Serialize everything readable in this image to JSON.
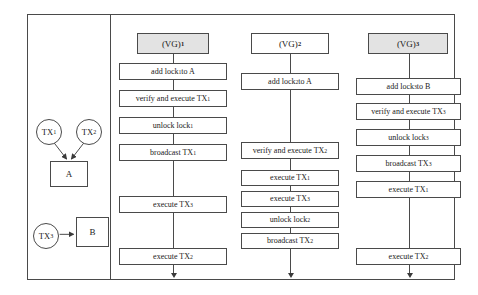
{
  "dependency_graph": {
    "label": "transaction dependency graph",
    "transactions": [
      {
        "id": "tx1",
        "label": "TX",
        "sub": "1"
      },
      {
        "id": "tx2",
        "label": "TX",
        "sub": "2"
      },
      {
        "id": "tx3",
        "label": "TX",
        "sub": "3"
      }
    ],
    "resources": [
      {
        "id": "a",
        "label": "A"
      },
      {
        "id": "b",
        "label": "B"
      }
    ],
    "edges": [
      {
        "from": "tx1",
        "to": "a"
      },
      {
        "from": "tx2",
        "to": "a"
      },
      {
        "from": "tx3",
        "to": "b"
      }
    ]
  },
  "columns": [
    {
      "header": {
        "prefix": "(VG)",
        "sub": "1",
        "shaded": true
      },
      "steps": [
        {
          "text": "add lock",
          "sub": "1",
          "suffix": " to A"
        },
        {
          "text": "verify and execute TX",
          "sub": "1",
          "suffix": ""
        },
        {
          "text": "unlock lock",
          "sub": "1",
          "suffix": ""
        },
        {
          "text": "broadcast TX",
          "sub": "1",
          "suffix": ""
        },
        {
          "text": "execute TX",
          "sub": "3",
          "suffix": ""
        },
        {
          "text": "execute TX",
          "sub": "2",
          "suffix": ""
        }
      ]
    },
    {
      "header": {
        "prefix": "(VG)",
        "sub": "2",
        "shaded": false
      },
      "steps": [
        {
          "text": "add lock",
          "sub": "2",
          "suffix": " to A"
        },
        {
          "text": "verify and execute TX",
          "sub": "2",
          "suffix": ""
        },
        {
          "text": "execute TX",
          "sub": "1",
          "suffix": ""
        },
        {
          "text": "execute TX",
          "sub": "3",
          "suffix": ""
        },
        {
          "text": "unlock lock",
          "sub": "2",
          "suffix": ""
        },
        {
          "text": "broadcast TX",
          "sub": "2",
          "suffix": ""
        }
      ]
    },
    {
      "header": {
        "prefix": "(VG)",
        "sub": "3",
        "shaded": true
      },
      "steps": [
        {
          "text": "add lock",
          "sub": "3",
          "suffix": " to B"
        },
        {
          "text": "verify and execute TX",
          "sub": "3",
          "suffix": ""
        },
        {
          "text": "unlock lock",
          "sub": "3",
          "suffix": ""
        },
        {
          "text": "broadcast TX",
          "sub": "3",
          "suffix": ""
        },
        {
          "text": "execute TX",
          "sub": "1",
          "suffix": ""
        },
        {
          "text": "execute TX",
          "sub": "2",
          "suffix": ""
        }
      ]
    }
  ],
  "layout": {
    "column_boxes": [
      [
        {
          "top": 18,
          "height": 21,
          "left": 18,
          "width": 72
        },
        {
          "top": 48,
          "height": 17,
          "left": 0,
          "width": 108
        },
        {
          "top": 75,
          "height": 17,
          "left": 0,
          "width": 108
        },
        {
          "top": 102,
          "height": 17,
          "left": 0,
          "width": 108
        },
        {
          "top": 129,
          "height": 17,
          "left": 0,
          "width": 108
        },
        {
          "top": 181,
          "height": 17,
          "left": 0,
          "width": 108
        },
        {
          "top": 233,
          "height": 17,
          "left": 0,
          "width": 108
        }
      ],
      [
        {
          "top": 18,
          "height": 21,
          "left": 10,
          "width": 78
        },
        {
          "top": 58,
          "height": 17,
          "left": 0,
          "width": 98
        },
        {
          "top": 127,
          "height": 17,
          "left": 0,
          "width": 98
        },
        {
          "top": 155,
          "height": 16,
          "left": 0,
          "width": 98
        },
        {
          "top": 176,
          "height": 16,
          "left": 0,
          "width": 98
        },
        {
          "top": 197,
          "height": 16,
          "left": 0,
          "width": 98
        },
        {
          "top": 218,
          "height": 16,
          "left": 0,
          "width": 98
        }
      ],
      [
        {
          "top": 18,
          "height": 21,
          "left": 12,
          "width": 80
        },
        {
          "top": 63,
          "height": 17,
          "left": 0,
          "width": 105
        },
        {
          "top": 88,
          "height": 17,
          "left": 0,
          "width": 105
        },
        {
          "top": 114,
          "height": 17,
          "left": 0,
          "width": 105
        },
        {
          "top": 140,
          "height": 17,
          "left": 0,
          "width": 105
        },
        {
          "top": 166,
          "height": 17,
          "left": 0,
          "width": 105
        },
        {
          "top": 233,
          "height": 17,
          "left": 0,
          "width": 105
        }
      ]
    ],
    "colors": {
      "stroke": "#4a4a4a",
      "header_shade": "#e3e3e3",
      "background": "#ffffff"
    }
  }
}
